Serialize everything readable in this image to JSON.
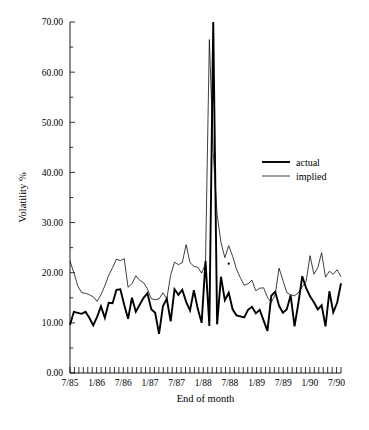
{
  "chart_data": {
    "type": "line",
    "title": "",
    "xlabel": "End of month",
    "ylabel": "Volatility %",
    "ylim": [
      0,
      70
    ],
    "ytick_step": 10,
    "yminor_step": 5,
    "grid": false,
    "legend_position": "upper-right",
    "ytick_labels": [
      "0.00",
      "10.00",
      "20.00",
      "30.00",
      "40.00",
      "50.00",
      "60.00",
      "70.00"
    ],
    "ytick_values": [
      0,
      10,
      20,
      30,
      40,
      50,
      60,
      70
    ],
    "xtick_labels": [
      "7/85",
      "1/86",
      "7/86",
      "1/87",
      "7/87",
      "1/88",
      "7/88",
      "1/89",
      "7/89",
      "1/90",
      "7/90"
    ],
    "xtick_indices": [
      1,
      7,
      13,
      19,
      25,
      31,
      37,
      43,
      49,
      55,
      61
    ],
    "x_minor_ticks": 62,
    "x_range_months": [
      "6/85",
      "7/90"
    ],
    "annotations": [
      {
        "name": "stray-speck",
        "x_index": 41,
        "y": 21.8
      }
    ],
    "series": [
      {
        "name": "actual",
        "style": "thick",
        "color": "#000000",
        "values": [
          9.6,
          12.2,
          12.0,
          11.8,
          12.2,
          11.0,
          9.5,
          11.2,
          13.3,
          11.0,
          14.0,
          13.9,
          16.6,
          16.7,
          13.6,
          10.8,
          15.0,
          12.2,
          13.6,
          15.0,
          15.9,
          12.7,
          12.0,
          7.8,
          13.3,
          14.8,
          10.3,
          16.7,
          15.6,
          16.6,
          14.2,
          12.5,
          16.5,
          12.8,
          10.0,
          22.3,
          9.4,
          70.0,
          9.7,
          19.2,
          14.5,
          16.0,
          12.7,
          11.5,
          11.3,
          11.1,
          12.6,
          13.2,
          11.9,
          12.6,
          10.5,
          8.4,
          15.4,
          16.2,
          13.4,
          12.0,
          12.7,
          15.5,
          9.3,
          14.0,
          19.3,
          16.9,
          15.3,
          14.1,
          12.7,
          13.5,
          9.3,
          16.3,
          12.1,
          14.0,
          17.9
        ]
      },
      {
        "name": "implied",
        "style": "thin",
        "color": "#000000",
        "values": [
          22.3,
          20.0,
          17.4,
          16.0,
          15.9,
          15.6,
          15.2,
          14.3,
          15.6,
          17.4,
          19.5,
          21.0,
          22.7,
          22.4,
          22.8,
          17.1,
          17.8,
          19.4,
          18.5,
          18.0,
          16.8,
          14.8,
          14.6,
          14.8,
          16.0,
          14.8,
          19.5,
          22.1,
          21.6,
          22.0,
          25.6,
          22.0,
          21.3,
          21.1,
          19.9,
          21.8,
          66.5,
          44.0,
          31.6,
          26.0,
          23.0,
          25.4,
          23.3,
          20.7,
          19.0,
          17.5,
          17.8,
          18.5,
          16.4,
          16.9,
          17.0,
          15.1,
          14.1,
          15.6,
          20.9,
          18.5,
          16.0,
          15.6,
          15.4,
          16.0,
          17.2,
          18.3,
          23.4,
          19.7,
          21.0,
          24.0,
          19.1,
          20.3,
          19.7,
          20.6,
          19.2
        ]
      }
    ]
  },
  "legend": {
    "items": [
      {
        "label": "actual",
        "style": "thick"
      },
      {
        "label": "implied",
        "style": "thin"
      }
    ]
  }
}
